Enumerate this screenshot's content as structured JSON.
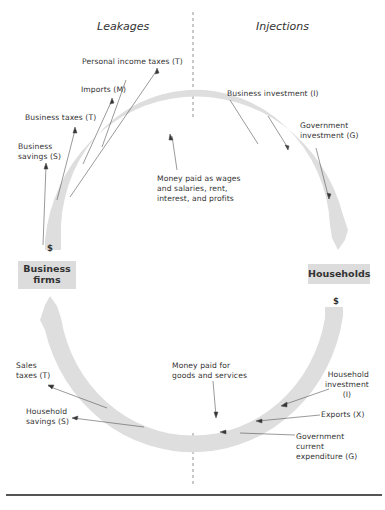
{
  "headers": {
    "left": "Leakages",
    "right": "Injections"
  },
  "sectors": {
    "business": {
      "line1": "Business",
      "line2": "firms"
    },
    "households": {
      "line1": "Households"
    }
  },
  "currency_symbol": "$",
  "flows": {
    "top": [
      "Money paid as wages",
      "and salaries, rent,",
      "interest, and profits"
    ],
    "bottom": [
      "Money paid for",
      "goods and services"
    ]
  },
  "leakages": {
    "personal_income_taxes": "Personal income taxes (T)",
    "imports": "Imports (M)",
    "business_taxes": "Business taxes (T)",
    "business_savings": [
      "Business",
      "savings (S)"
    ],
    "sales_taxes": [
      "Sales",
      "taxes (T)"
    ],
    "household_savings": [
      "Household",
      "savings (S)"
    ]
  },
  "injections": {
    "business_investment": "Business investment (I)",
    "government_investment": [
      "Government",
      "investment (G)"
    ],
    "household_investment": [
      "Household",
      "investment",
      "(I)"
    ],
    "exports": "Exports (X)",
    "government_current_expenditure": [
      "Government",
      "current",
      "expenditure (G)"
    ]
  },
  "colors": {
    "ring": "#dedede",
    "text": "#333333",
    "line": "#555555"
  }
}
